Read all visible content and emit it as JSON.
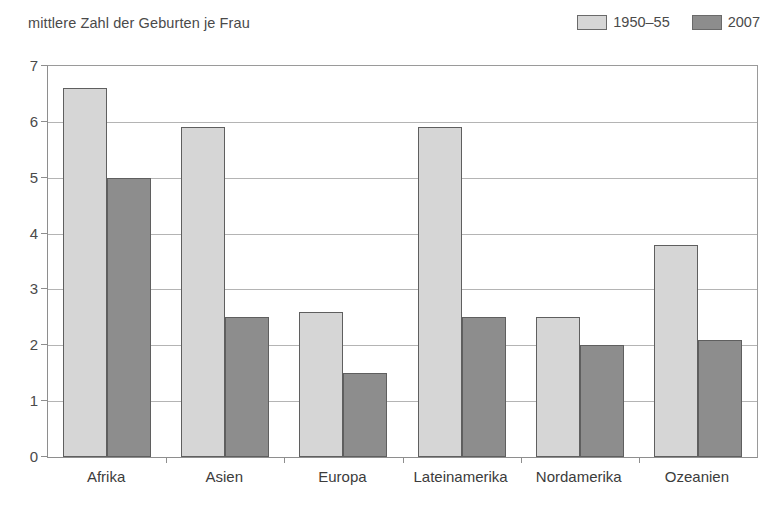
{
  "chart_data": {
    "type": "bar",
    "title": "mittlere Zahl der Geburten je Frau",
    "xlabel": "",
    "ylabel": "",
    "ylim": [
      0,
      7
    ],
    "yticks": [
      0,
      1,
      2,
      3,
      4,
      5,
      6,
      7
    ],
    "ytick_labels": [
      "0",
      "1",
      "2",
      "3",
      "4",
      "5",
      "6",
      "7"
    ],
    "grid": true,
    "legend_position": "top-right",
    "categories": [
      "Afrika",
      "Asien",
      "Europa",
      "Lateinamerika",
      "Nordamerika",
      "Ozeanien"
    ],
    "series": [
      {
        "name": "1950–55",
        "color": "#d6d6d6",
        "values": [
          6.6,
          5.9,
          2.6,
          5.9,
          2.5,
          3.8
        ]
      },
      {
        "name": "2007",
        "color": "#8d8d8d",
        "values": [
          5.0,
          2.5,
          1.5,
          2.5,
          2.0,
          2.1
        ]
      }
    ]
  },
  "legend": {
    "entries": [
      {
        "label": "1950–55",
        "color": "#d6d6d6"
      },
      {
        "label": "2007",
        "color": "#8d8d8d"
      }
    ]
  },
  "colors": {
    "series_1950_55": "#d6d6d6",
    "series_2007": "#8d8d8d",
    "bar_border": "#5f5f5f",
    "gridline": "#b4b4b4",
    "axis": "#8e8e8e",
    "text": "#3c3c3c",
    "background": "#ffffff"
  }
}
